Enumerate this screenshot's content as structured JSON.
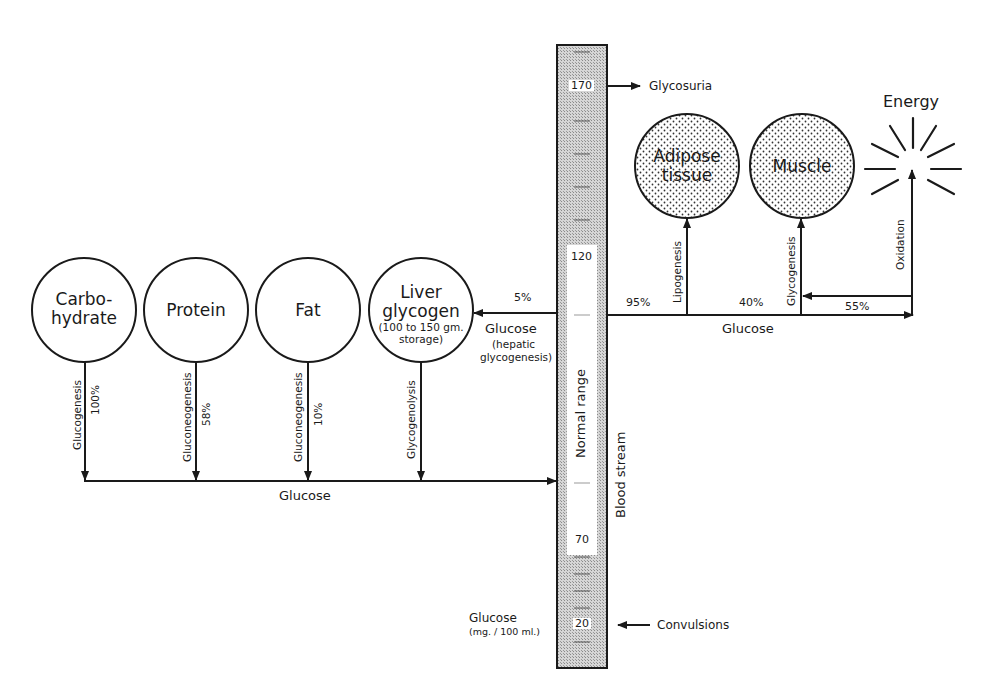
{
  "diagram": {
    "sources": [
      {
        "name": "Carbohydrate",
        "line1": "Carbo-",
        "line2": "hydrate",
        "process": "Glucogenesis",
        "percent": "100%"
      },
      {
        "name": "Protein",
        "line1": "Protein",
        "process": "Gluconeogenesis",
        "percent": "58%"
      },
      {
        "name": "Fat",
        "line1": "Fat",
        "process": "Gluconeogenesis",
        "percent": "10%"
      },
      {
        "name": "Liver glycogen",
        "line1": "Liver",
        "line2": "glycogen",
        "line3": "(100 to 150 gm.",
        "line4": "storage)",
        "process": "Glycogenolysis"
      }
    ],
    "bottom_flow_label": "Glucose",
    "hepatic": {
      "percent": "5%",
      "label": "Glucose",
      "sub1": "(hepatic",
      "sub2": "glycogenesis)"
    },
    "bloodstream": {
      "label": "Blood stream",
      "normal_label": "Normal range",
      "ticks": [
        "170",
        "120",
        "70",
        "20"
      ],
      "axis_label": "Glucose",
      "axis_unit": "(mg. / 100 ml.)",
      "high_event": "Glycosuria",
      "low_event": "Convulsions"
    },
    "sinks": [
      {
        "name": "Adipose tissue",
        "line1": "Adipose",
        "line2": "tissue",
        "process": "Lipogenesis"
      },
      {
        "name": "Muscle",
        "line1": "Muscle",
        "process": "Glycogenesis"
      },
      {
        "name": "Energy",
        "line1": "Energy",
        "process": "Oxidation"
      }
    ],
    "right_flow": {
      "label": "Glucose",
      "p_total": "95%",
      "p_muscle": "40%",
      "p_energy": "55%"
    },
    "colors": {
      "ink": "#1a1a1a",
      "stipple": "#b5b5b5",
      "background": "#ffffff"
    }
  }
}
